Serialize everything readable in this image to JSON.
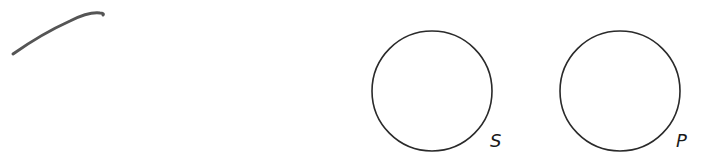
{
  "diagram": {
    "stroke_mark": {
      "description": "hand-drawn curved pencil stroke",
      "color": "#555555"
    },
    "circles": [
      {
        "id": "S",
        "label": "S",
        "cx": 432,
        "cy": 91,
        "r": 60
      },
      {
        "id": "P",
        "label": "P",
        "cx": 620,
        "cy": 91,
        "r": 60
      }
    ],
    "colors": {
      "stroke": "#2a2a2a",
      "background": "#ffffff"
    }
  }
}
